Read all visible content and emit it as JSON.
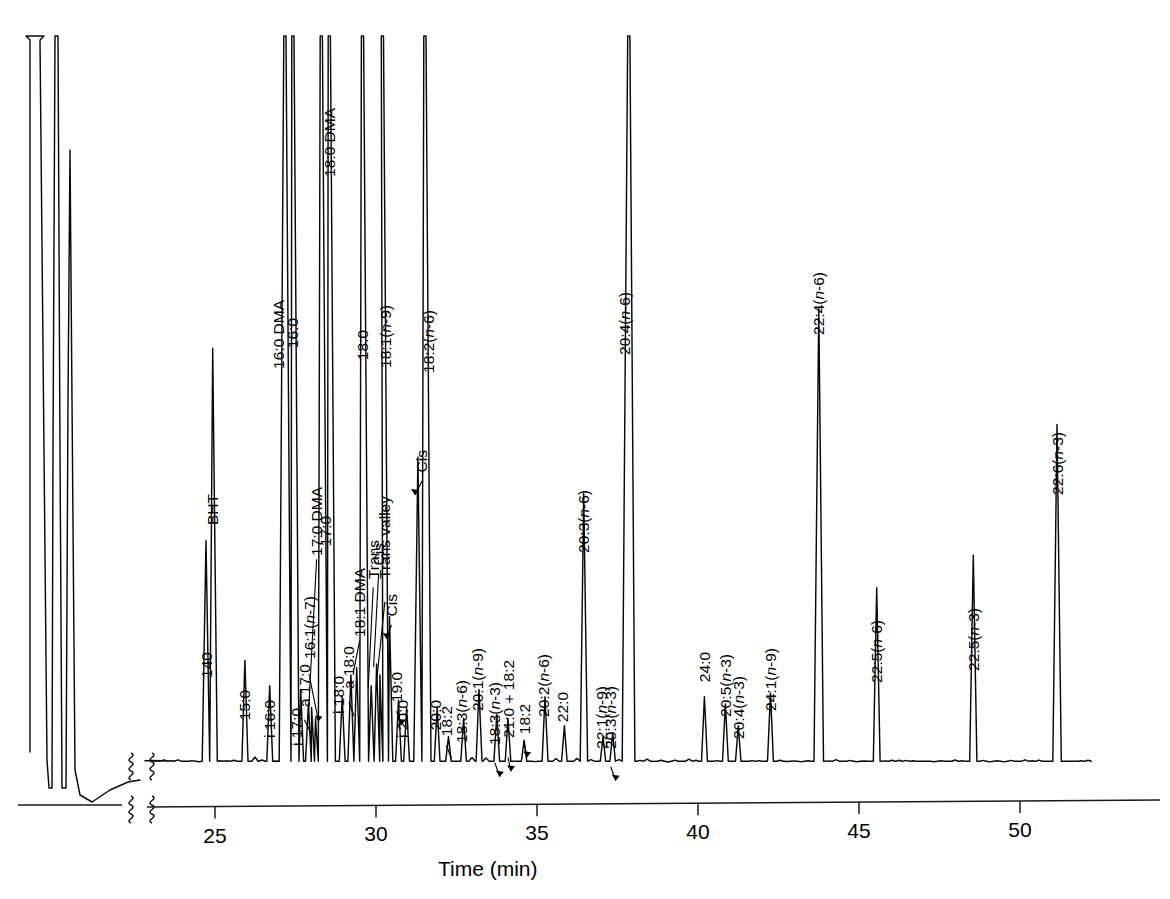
{
  "figure": {
    "title": "",
    "axis": {
      "xlabel": "Time (min)",
      "ticks": [
        "25",
        "30",
        "35",
        "40",
        "45",
        "50"
      ],
      "tick_values": [
        25,
        30,
        35,
        40,
        45,
        50
      ],
      "break_symbol": "axis-break-squiggle"
    }
  },
  "chart_data": {
    "type": "line",
    "title": "",
    "subtitle": "",
    "xlabel": "Time (min)",
    "ylabel": "",
    "xlim": [
      22.2,
      52.5
    ],
    "ylim": [
      0,
      100
    ],
    "grid": false,
    "legend": null,
    "axis_breaks": [
      "x-axis break between solvent region and 22.2 min",
      "baseline break marks"
    ],
    "solvent_peaks": [
      {
        "label": "",
        "rt_px_only": true,
        "height": 100,
        "clipped": true
      },
      {
        "label": "",
        "rt_px_only": true,
        "height": 100,
        "clipped": true
      },
      {
        "label": "",
        "rt_px_only": true,
        "height": 76,
        "clipped": false
      }
    ],
    "peaks": [
      {
        "name": "140",
        "rt": 24.72,
        "height": 30.5,
        "clipped": false,
        "labelled": true
      },
      {
        "name": "BHT",
        "rt": 24.93,
        "height": 57.0,
        "clipped": false,
        "labelled": true
      },
      {
        "name": "15:0",
        "rt": 25.93,
        "height": 14.0,
        "clipped": false,
        "labelled": true
      },
      {
        "name": "i 16:0",
        "rt": 26.7,
        "height": 10.5,
        "clipped": false,
        "labelled": true
      },
      {
        "name": "16:0 DMA",
        "rt": 27.17,
        "height": 100,
        "clipped": true,
        "labelled": true
      },
      {
        "name": "16:0",
        "rt": 27.42,
        "height": 100,
        "clipped": true,
        "labelled": true
      },
      {
        "name": "i 17:0",
        "rt": 27.66,
        "height": 10.0,
        "clipped": false,
        "labelled": true
      },
      {
        "name": "a 17:0",
        "rt": 27.9,
        "height": 8.0,
        "clipped": false,
        "labelled": true
      },
      {
        "name": "16:1(n-7)",
        "rt": 28.12,
        "height": 6.0,
        "clipped": false,
        "labelled": true
      },
      {
        "name": "17:0 DMA",
        "rt": 28.0,
        "height": 7.5,
        "clipped": false,
        "labelled": true
      },
      {
        "name": "17:0",
        "rt": 28.3,
        "height": 100,
        "clipped": true,
        "labelled": true
      },
      {
        "name": "18:0 DMA",
        "rt": 28.55,
        "height": 100,
        "clipped": true,
        "labelled": true
      },
      {
        "name": "i 18:0",
        "rt": 28.95,
        "height": 9.0,
        "clipped": false,
        "labelled": true
      },
      {
        "name": "a 18:0",
        "rt": 29.22,
        "height": 12.0,
        "clipped": false,
        "labelled": true
      },
      {
        "name": "18:1 DMA",
        "rt": 29.4,
        "height": 13.0,
        "clipped": false,
        "labelled": true
      },
      {
        "name": "18:0",
        "rt": 29.58,
        "height": 100,
        "clipped": true,
        "labelled": true
      },
      {
        "name": "Trans",
        "rt": 29.85,
        "height": 10.5,
        "clipped": false,
        "labelled": true
      },
      {
        "name": "Cis",
        "rt": 30.02,
        "height": 13.5,
        "clipped": false,
        "labelled": true
      },
      {
        "name": "Trans valley",
        "rt": 30.12,
        "height": 12.0,
        "clipped": false,
        "labelled": true
      },
      {
        "name": "18:1(n-9)",
        "rt": 30.2,
        "height": 100,
        "clipped": true,
        "labelled": true
      },
      {
        "name": "Cis",
        "rt": 30.42,
        "height": 20.0,
        "clipped": false,
        "labelled": true
      },
      {
        "name": "19:0",
        "rt": 30.7,
        "height": 8.5,
        "clipped": false,
        "labelled": true
      },
      {
        "name": "i 20:0",
        "rt": 30.95,
        "height": 7.5,
        "clipped": false,
        "labelled": true
      },
      {
        "name": "Cis",
        "rt": 31.3,
        "height": 42.0,
        "clipped": false,
        "labelled": true
      },
      {
        "name": "18:2(n-6)",
        "rt": 31.52,
        "height": 100,
        "clipped": true,
        "labelled": true
      },
      {
        "name": "20:0",
        "rt": 31.9,
        "height": 7.5,
        "clipped": false,
        "labelled": true
      },
      {
        "name": "18:2",
        "rt": 32.25,
        "height": 3.5,
        "clipped": false,
        "labelled": true
      },
      {
        "name": "18:3(n-6)",
        "rt": 32.72,
        "height": 6.0,
        "clipped": false,
        "labelled": true
      },
      {
        "name": "20:1(n-9)",
        "rt": 33.2,
        "height": 10.0,
        "clipped": false,
        "labelled": true
      },
      {
        "name": "18:3(n-3)",
        "rt": 33.75,
        "height": 6.5,
        "clipped": false,
        "labelled": true
      },
      {
        "name": "21:0 + 18:2",
        "rt": 34.1,
        "height": 6.0,
        "clipped": false,
        "labelled": true
      },
      {
        "name": "18:2",
        "rt": 34.6,
        "height": 3.0,
        "clipped": false,
        "labelled": true
      },
      {
        "name": "20:2(n-6)",
        "rt": 35.25,
        "height": 9.0,
        "clipped": false,
        "labelled": true
      },
      {
        "name": "22:0",
        "rt": 35.85,
        "height": 5.0,
        "clipped": false,
        "labelled": true
      },
      {
        "name": "20:3(n-6)",
        "rt": 36.45,
        "height": 37.0,
        "clipped": false,
        "labelled": true
      },
      {
        "name": "22:1(n-9)",
        "rt": 37.05,
        "height": 3.5,
        "clipped": false,
        "labelled": true
      },
      {
        "name": "20:3(n-3)",
        "rt": 37.35,
        "height": 4.0,
        "clipped": false,
        "labelled": true
      },
      {
        "name": "20:4(n-6)",
        "rt": 37.85,
        "height": 100,
        "clipped": true,
        "labelled": true
      },
      {
        "name": "24:0",
        "rt": 40.2,
        "height": 9.0,
        "clipped": false,
        "labelled": true
      },
      {
        "name": "20:5(n-3)",
        "rt": 40.85,
        "height": 8.0,
        "clipped": false,
        "labelled": true
      },
      {
        "name": "20:4(n-3)",
        "rt": 41.25,
        "height": 5.0,
        "clipped": false,
        "labelled": true
      },
      {
        "name": "24:1(n-9)",
        "rt": 42.25,
        "height": 9.5,
        "clipped": false,
        "labelled": true
      },
      {
        "name": "22:4(n-6)",
        "rt": 43.75,
        "height": 62.5,
        "clipped": false,
        "labelled": true
      },
      {
        "name": "22:5(n-6)",
        "rt": 45.55,
        "height": 24.0,
        "clipped": false,
        "labelled": true
      },
      {
        "name": "22:5(n-3)",
        "rt": 48.55,
        "height": 28.5,
        "clipped": false,
        "labelled": true
      },
      {
        "name": "22:6(n-3)",
        "rt": 51.15,
        "height": 46.5,
        "clipped": false,
        "labelled": true
      }
    ]
  },
  "labels": {
    "l140": "140",
    "bht": "BHT",
    "p15_0": "15:0",
    "i16_0": "i 16:0",
    "dma16_0": "16:0 DMA",
    "p16_0": "16:0",
    "i17_0": "i 17:0",
    "a17_0": "a 17:0",
    "p16_1n7": "16:1(n-7)",
    "dma17_0": "17:0 DMA",
    "p17_0": "17:0",
    "dma18_0": "18:0 DMA",
    "i18_0": "i 18:0",
    "a18_0": "a 18:0",
    "dma18_1": "18:1 DMA",
    "p18_0": "18:0",
    "trans": "Trans",
    "cis_a": "Cis",
    "trans_valley": "Trans valley",
    "p18_1n9": "18:1(n-9)",
    "cis_b": "Cis",
    "p19_0": "19:0",
    "i20_0": "i 20:0",
    "cis_c": "Cis",
    "p18_2n6": "18:2(n-6)",
    "p20_0": "20:0",
    "p18_2a": "18:2",
    "p18_3n6": "18:3(n-6)",
    "p20_1n9": "20:1(n-9)",
    "p18_3n3": "18:3(n-3)",
    "p21_0_18_2": "21:0 + 18:2",
    "p18_2b": "18:2",
    "p20_2n6": "20:2(n-6)",
    "p22_0": "22:0",
    "p20_3n6": "20:3(n-6)",
    "p22_1n9": "22:1(n-9)",
    "p20_3n3": "20:3(n-3)",
    "p20_4n6": "20:4(n-6)",
    "p24_0": "24:0",
    "p20_5n3": "20:5(n-3)",
    "p20_4n3": "20:4(n-3)",
    "p24_1n9": "24:1(n-9)",
    "p22_4n6": "22:4(n-6)",
    "p22_5n6": "22:5(n-6)",
    "p22_5n3": "22:5(n-3)",
    "p22_6n3": "22:6(n-3)"
  }
}
